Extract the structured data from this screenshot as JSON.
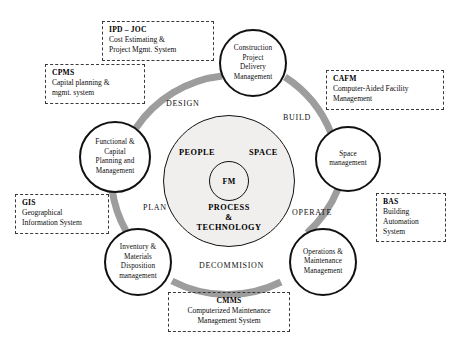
{
  "diagram": {
    "colors": {
      "arc": "#9a9a9a",
      "ring_fill": "#f0efee",
      "stroke": "#111111",
      "dashed_border": "#3a3a3a",
      "background": "#ffffff"
    },
    "core": {
      "center_label": "FM",
      "people": "PEOPLE",
      "space": "SPACE",
      "process_line1": "PROCESS",
      "process_line2": "&",
      "process_line3": "TECHNOLOGY"
    },
    "phases": [
      {
        "id": "design",
        "label": "DESIGN"
      },
      {
        "id": "build",
        "label": "BUILD"
      },
      {
        "id": "operate",
        "label": "OPERATE"
      },
      {
        "id": "decommision",
        "label": "DECOMMISION"
      },
      {
        "id": "plan",
        "label": "PLAN"
      }
    ],
    "nodes": [
      {
        "id": "construction-project-delivery-management",
        "lines": [
          "Construction",
          "Project",
          "Delivery",
          "Management"
        ]
      },
      {
        "id": "space-management",
        "lines": [
          "Space",
          "management"
        ]
      },
      {
        "id": "operations-maintenance-management",
        "lines": [
          "Operations &",
          "Maintenance",
          "Management"
        ]
      },
      {
        "id": "inventory-materials-disposition-management",
        "lines": [
          "Inventory &",
          "Materials",
          "Disposition",
          "management"
        ]
      },
      {
        "id": "functional-capital-planning-management",
        "lines": [
          "Functional &",
          "Capital",
          "Planning and",
          "Management"
        ]
      }
    ],
    "annotations": [
      {
        "id": "ipd-joc",
        "title": "IPD – JOC",
        "lines": [
          "Cost Estimating &",
          "Project Mgmt. System"
        ]
      },
      {
        "id": "cpms",
        "title": "CPMS",
        "lines": [
          "Capital planning &",
          "mgmt. system"
        ]
      },
      {
        "id": "cafm",
        "title": "CAFM",
        "lines": [
          "Computer-Aided Facility",
          "Management"
        ]
      },
      {
        "id": "bas",
        "title": "BAS",
        "lines": [
          "Building",
          "Automation",
          "System"
        ]
      },
      {
        "id": "gis",
        "title": "GIS",
        "lines": [
          "Geographical",
          "Information System"
        ]
      },
      {
        "id": "cmms",
        "title": "CMMS",
        "lines": [
          "Computerized Maintenance",
          "Management System"
        ]
      }
    ]
  }
}
